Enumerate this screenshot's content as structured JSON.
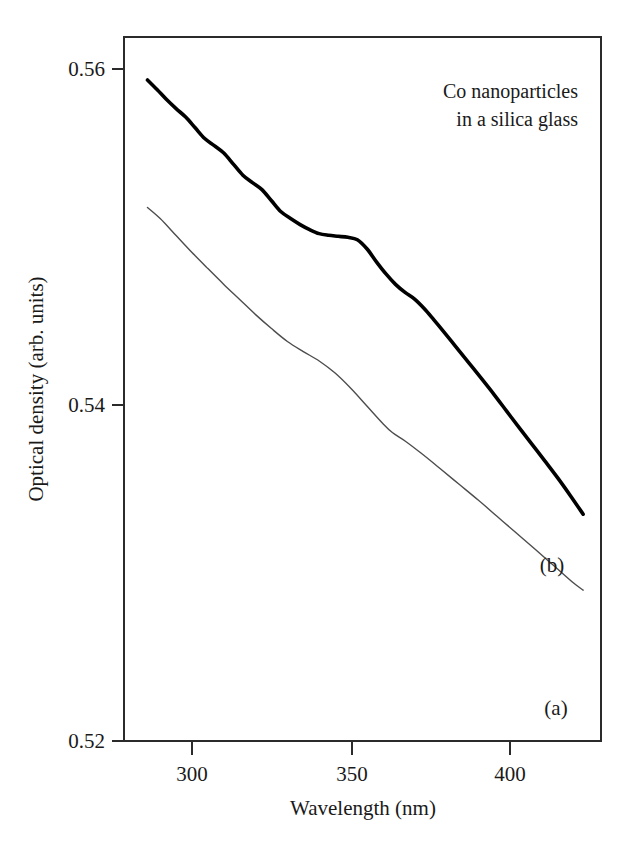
{
  "chart_data": {
    "type": "line",
    "title": "",
    "annotation": [
      "Co nanoparticles",
      "in a silica glass"
    ],
    "xlabel": "Wavelength (nm)",
    "ylabel": "Optical density (arb. units)",
    "xlim": [
      285,
      423
    ],
    "ylim": [
      0.52,
      0.56
    ],
    "xticks": [
      300,
      350,
      400
    ],
    "xtick_labels": [
      "300",
      "350",
      "400"
    ],
    "yticks": [
      0.52,
      0.54,
      0.56
    ],
    "ytick_labels": [
      "0.52",
      "0.54",
      "0.56"
    ],
    "grid": false,
    "legend_position": "inline-right",
    "frame": "box",
    "series": [
      {
        "name": "(a)",
        "label": "(a)",
        "color": "#4d4d4d",
        "line_width": 1.4,
        "x": [
          286,
          290,
          295,
          300,
          305,
          310,
          315,
          320,
          325,
          330,
          335,
          340,
          345,
          350,
          355,
          360,
          363,
          367,
          372,
          378,
          384,
          390,
          396,
          402,
          408,
          414,
          420,
          423
        ],
        "y": [
          0.55176,
          0.5511,
          0.55009,
          0.54908,
          0.54812,
          0.54718,
          0.54628,
          0.54538,
          0.54455,
          0.54378,
          0.54318,
          0.54262,
          0.5419,
          0.54098,
          0.53994,
          0.5389,
          0.53836,
          0.53786,
          0.53714,
          0.53622,
          0.53528,
          0.53434,
          0.53336,
          0.53238,
          0.5314,
          0.5304,
          0.5294,
          0.52898
        ]
      },
      {
        "name": "(b)",
        "label": "(b)",
        "color": "#000000",
        "line_width": 3.6,
        "x": [
          286,
          289,
          292,
          295,
          298,
          301,
          304,
          307,
          310,
          313,
          316,
          319,
          322,
          325,
          328,
          331,
          334,
          337,
          340,
          343,
          346,
          349,
          352,
          355,
          358,
          361,
          364,
          367,
          370,
          373,
          376,
          379,
          383,
          387,
          391,
          395,
          399,
          403,
          407,
          411,
          415,
          419,
          423
        ],
        "y": [
          0.55935,
          0.55878,
          0.55818,
          0.55764,
          0.55714,
          0.5565,
          0.55586,
          0.55544,
          0.555,
          0.55434,
          0.55368,
          0.55324,
          0.55282,
          0.55216,
          0.5515,
          0.5511,
          0.55074,
          0.55044,
          0.5502,
          0.5501,
          0.55004,
          0.54998,
          0.54984,
          0.5493,
          0.54852,
          0.5478,
          0.54718,
          0.5467,
          0.5463,
          0.54574,
          0.54508,
          0.5444,
          0.54346,
          0.54252,
          0.54158,
          0.54062,
          0.53962,
          0.53862,
          0.53764,
          0.53666,
          0.53566,
          0.5346,
          0.5335
        ]
      }
    ]
  },
  "labels": {
    "ytick_0": "0.52",
    "ytick_1": "0.54",
    "ytick_2": "0.56",
    "xtick_0": "300",
    "xtick_1": "350",
    "xtick_2": "400",
    "x_axis_title": "Wavelength (nm)",
    "y_axis_title": "Optical density (arb. units)",
    "annotation_line1": "Co nanoparticles",
    "annotation_line2": "in a silica glass",
    "series_a_label": "(a)",
    "series_b_label": "(b)"
  },
  "colors": {
    "background": "#ffffff",
    "frame": "#2b2b2b",
    "series_a": "#4d4d4d",
    "series_b": "#000000",
    "text": "#1a1a1a"
  }
}
